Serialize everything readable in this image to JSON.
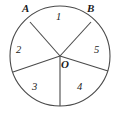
{
  "figure": {
    "type": "circle-sector-diagram",
    "stroke_color": "#4a4a4a",
    "text_color": "#1a1a1a",
    "background_color": "#ffffff",
    "circle": {
      "center_x": 60,
      "center_y": 56,
      "radius": 50
    },
    "center_point": {
      "name": "center-point-o",
      "label": "O",
      "x": 60,
      "y": 56,
      "label_x": 61,
      "label_y": 59
    },
    "boundary_points": [
      {
        "name": "point-a",
        "label": "A",
        "x": 30,
        "y": 22,
        "label_x": 22,
        "label_y": 3
      },
      {
        "name": "point-b",
        "label": "B",
        "x": 91,
        "y": 22,
        "label_x": 87,
        "label_y": 3
      }
    ],
    "radii": [
      {
        "name": "radius-to-a",
        "angle_deg": 125,
        "end_x": 30,
        "end_y": 22
      },
      {
        "name": "radius-to-b",
        "angle_deg": 55,
        "end_x": 91,
        "end_y": 22
      },
      {
        "name": "radius-lower-left",
        "angle_deg": 199,
        "end_x": 13,
        "end_y": 72
      },
      {
        "name": "radius-down",
        "angle_deg": 270,
        "end_x": 60,
        "end_y": 106
      },
      {
        "name": "radius-lower-right",
        "angle_deg": 342,
        "end_x": 108,
        "end_y": 71
      }
    ],
    "sectors": [
      {
        "name": "sector-1",
        "label": "1",
        "label_x": 56,
        "label_y": 12
      },
      {
        "name": "sector-2",
        "label": "2",
        "label_x": 16,
        "label_y": 45
      },
      {
        "name": "sector-3",
        "label": "3",
        "label_x": 32,
        "label_y": 82
      },
      {
        "name": "sector-4",
        "label": "4",
        "label_x": 77,
        "label_y": 82
      },
      {
        "name": "sector-5",
        "label": "5",
        "label_x": 94,
        "label_y": 45
      }
    ]
  }
}
